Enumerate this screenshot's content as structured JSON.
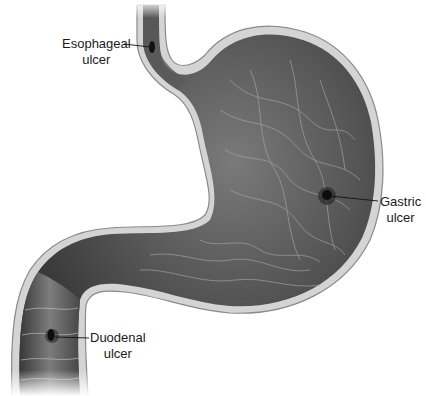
{
  "figure": {
    "colors": {
      "background": "#ffffff",
      "lumen_dark": "#3a3a3a",
      "lumen_mid": "#6a6a6a",
      "wall": "#cfcfcf",
      "wall_outline": "#8a8a8a",
      "ulcer": "#111111",
      "leader_line": "#111111",
      "label_text": "#1a1a1a"
    }
  },
  "labels": [
    {
      "id": "esophageal",
      "line1": "Esophageal",
      "line2": "ulcer"
    },
    {
      "id": "gastric",
      "line1": "Gastric",
      "line2": "ulcer"
    },
    {
      "id": "duodenal",
      "line1": "Duodenal",
      "line2": "ulcer"
    }
  ]
}
